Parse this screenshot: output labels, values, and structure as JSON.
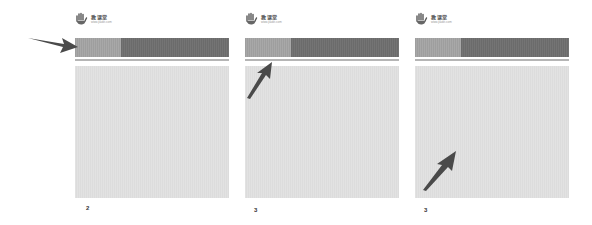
{
  "logo": {
    "icon": "hand-icon",
    "text_cn": "教课堂",
    "url_text": "www.jiaokt.com"
  },
  "colors": {
    "header_light": "#a3a3a3",
    "header_dark": "#707070",
    "content_bg": "#dfdfdf",
    "arrow": "#4a4a4a",
    "rule": "#b5b5b5"
  },
  "panels": [
    {
      "step_label": "2",
      "arrow_target": "header-bar-left-segment",
      "arrow_direction": "right"
    },
    {
      "step_label": "3",
      "arrow_target": "header-bar-left-segment-bottom",
      "arrow_direction": "up-right"
    },
    {
      "step_label": "3",
      "arrow_target": "content-area-center",
      "arrow_direction": "up-right"
    }
  ]
}
